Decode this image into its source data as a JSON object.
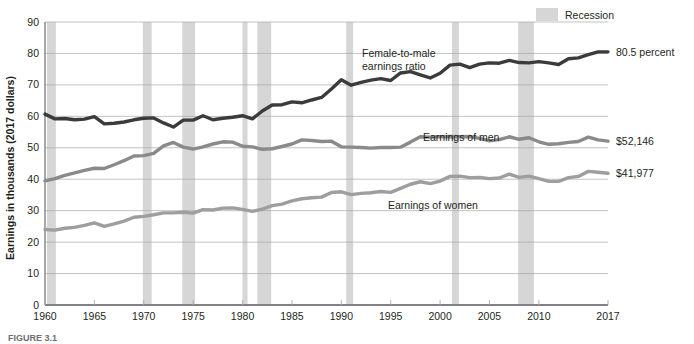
{
  "figure": {
    "caption": "FIGURE 3.1",
    "legend": {
      "label": "Recession",
      "swatch_color": "#d6d6d6"
    }
  },
  "chart_data": {
    "type": "line",
    "title": "",
    "xlabel": "",
    "ylabel": "Earnings in thousands (2017 dollars)",
    "xlim": [
      1960,
      2017
    ],
    "ylim": [
      0,
      90
    ],
    "ytick_step": 10,
    "yticks": [
      0,
      10,
      20,
      30,
      40,
      50,
      60,
      70,
      80,
      90
    ],
    "xticks": [
      1960,
      1965,
      1970,
      1975,
      1980,
      1985,
      1990,
      1995,
      2000,
      2005,
      2010,
      2017
    ],
    "xtick_labels": [
      "1960",
      "1965",
      "1970",
      "1975",
      "1980",
      "1985",
      "1990",
      "1995",
      "2000",
      "2005",
      "2010",
      "2017"
    ],
    "ytick_labels": [
      "0",
      "10",
      "20",
      "30",
      "40",
      "50",
      "60",
      "70",
      "80",
      "90"
    ],
    "grid": "horizontal",
    "legend_position": "top-right",
    "x": [
      1960,
      1961,
      1962,
      1963,
      1964,
      1965,
      1966,
      1967,
      1968,
      1969,
      1970,
      1971,
      1972,
      1973,
      1974,
      1975,
      1976,
      1977,
      1978,
      1979,
      1980,
      1981,
      1982,
      1983,
      1984,
      1985,
      1986,
      1987,
      1988,
      1989,
      1990,
      1991,
      1992,
      1993,
      1994,
      1995,
      1996,
      1997,
      1998,
      1999,
      2000,
      2001,
      2002,
      2003,
      2004,
      2005,
      2006,
      2007,
      2008,
      2009,
      2010,
      2011,
      2012,
      2013,
      2014,
      2015,
      2016,
      2017
    ],
    "series": [
      {
        "name": "Female-to-male earnings ratio",
        "units": "percent",
        "color": "#3b3b3b",
        "end_label": "80.5 percent",
        "end_value": 80.5,
        "values": [
          60.7,
          59.2,
          59.3,
          58.9,
          59.1,
          59.9,
          57.6,
          57.8,
          58.2,
          58.9,
          59.4,
          59.5,
          57.9,
          56.6,
          58.8,
          58.8,
          60.2,
          58.9,
          59.4,
          59.7,
          60.2,
          59.2,
          61.7,
          63.6,
          63.7,
          64.6,
          64.3,
          65.2,
          66.0,
          68.7,
          71.6,
          69.9,
          70.8,
          71.5,
          72.0,
          71.4,
          73.8,
          74.2,
          73.2,
          72.2,
          73.7,
          76.3,
          76.6,
          75.5,
          76.6,
          77.0,
          76.9,
          77.8,
          77.1,
          77.0,
          77.4,
          77.0,
          76.5,
          78.3,
          78.6,
          79.6,
          80.5,
          80.5
        ]
      },
      {
        "name": "Earnings of men",
        "units": "2017 dollars",
        "color": "#8a8a8a",
        "end_label": "$52,146",
        "end_value": 52146,
        "values": [
          39.5,
          40.2,
          41.2,
          42.0,
          42.8,
          43.5,
          43.4,
          44.6,
          45.9,
          47.4,
          47.5,
          48.2,
          50.6,
          51.7,
          50.2,
          49.6,
          50.3,
          51.2,
          51.9,
          51.8,
          50.5,
          50.3,
          49.5,
          49.7,
          50.4,
          51.2,
          52.5,
          52.3,
          52.0,
          52.1,
          50.3,
          50.2,
          50.1,
          49.9,
          50.1,
          50.1,
          50.2,
          51.8,
          53.5,
          53.4,
          53.5,
          53.6,
          53.5,
          53.6,
          53.0,
          52.2,
          52.6,
          53.5,
          52.7,
          53.2,
          51.9,
          51.1,
          51.3,
          51.7,
          52.0,
          53.4,
          52.5,
          52.1
        ]
      },
      {
        "name": "Earnings of women",
        "units": "2017 dollars",
        "color": "#9e9e9e",
        "end_label": "$41,977",
        "end_value": 41977,
        "values": [
          24.0,
          23.8,
          24.4,
          24.7,
          25.3,
          26.1,
          25.0,
          25.8,
          26.7,
          27.9,
          28.2,
          28.7,
          29.3,
          29.3,
          29.5,
          29.2,
          30.3,
          30.2,
          30.8,
          30.9,
          30.4,
          29.8,
          30.5,
          31.6,
          32.1,
          33.1,
          33.8,
          34.1,
          34.3,
          35.8,
          36.0,
          35.1,
          35.5,
          35.7,
          36.1,
          35.8,
          37.1,
          38.4,
          39.2,
          38.6,
          39.4,
          40.9,
          41.0,
          40.5,
          40.6,
          40.2,
          40.4,
          41.6,
          40.6,
          41.0,
          40.2,
          39.3,
          39.3,
          40.5,
          40.9,
          42.5,
          42.2,
          41.9
        ]
      }
    ],
    "recessions": [
      {
        "start": 1960.2,
        "end": 1961.1
      },
      {
        "start": 1969.9,
        "end": 1970.8
      },
      {
        "start": 1973.9,
        "end": 1975.2
      },
      {
        "start": 1980.0,
        "end": 1980.5
      },
      {
        "start": 1981.5,
        "end": 1982.9
      },
      {
        "start": 1990.5,
        "end": 1991.2
      },
      {
        "start": 2001.2,
        "end": 2001.9
      },
      {
        "start": 2007.9,
        "end": 2009.5
      }
    ]
  }
}
